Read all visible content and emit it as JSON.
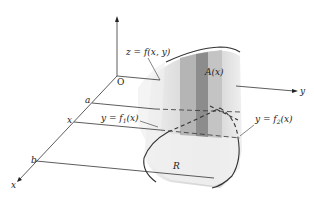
{
  "diagram": {
    "type": "3d-integration-region",
    "axes": {
      "z_label": "",
      "y_label": "y",
      "x_label": "x",
      "origin_label": "O"
    },
    "x_axis_marks": {
      "a": "a",
      "x": "x",
      "b": "b"
    },
    "labels": {
      "surface": "z = f(x,  y)",
      "cross_section": "A(x)",
      "lower_curve_prefix": "y = f",
      "lower_curve_sub": "1",
      "lower_curve_suffix": "(x)",
      "upper_curve_prefix": "y = f",
      "upper_curve_sub": "2",
      "upper_curve_suffix": "(x)",
      "region": "R"
    },
    "colors": {
      "line": "#333333",
      "solid_light": "#e6e6e6",
      "solid_mid": "#c8c8c8",
      "slab": "#8a8a8a",
      "slab_side": "#a8a8a8"
    }
  }
}
